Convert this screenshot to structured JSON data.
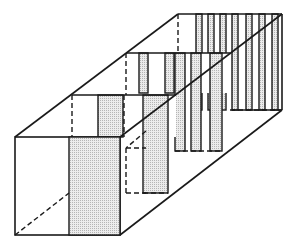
{
  "diagram": {
    "title": "Perspective box divided into three sections with shaded vertical panels",
    "colors": {
      "line": "#1a1a1a",
      "shade": "#d9d9d9",
      "background": "#ffffff"
    },
    "sections": [
      {
        "name": "front",
        "shaded_panels": 1,
        "visible_strips": 1
      },
      {
        "name": "middle",
        "shaded_panels": 2,
        "visible_strips": 2
      },
      {
        "name": "rear",
        "shaded_panels": 3,
        "visible_strips": 3
      },
      {
        "name": "back",
        "shaded_panels": 6,
        "visible_strips": 6
      }
    ]
  }
}
